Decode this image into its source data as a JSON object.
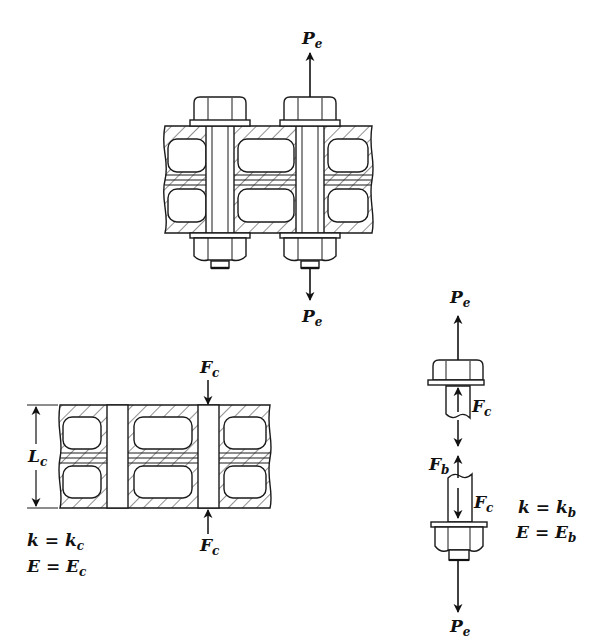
{
  "figure": {
    "assembly": {
      "name": "bolted-assembly",
      "bolt_count": 2,
      "loads": {
        "top": {
          "symbol": "P",
          "subscript": "e"
        },
        "bottom": {
          "symbol": "P",
          "subscript": "e"
        }
      }
    },
    "member_fbd": {
      "name": "member-free-body",
      "dimension": {
        "symbol": "L",
        "subscript": "c"
      },
      "loads": {
        "top": {
          "symbol": "F",
          "subscript": "c"
        },
        "bottom": {
          "symbol": "F",
          "subscript": "c"
        }
      },
      "properties": [
        {
          "lhs": "k",
          "eq": "=",
          "symbol": "k",
          "subscript": "c"
        },
        {
          "lhs": "E",
          "eq": "=",
          "symbol": "E",
          "subscript": "c"
        }
      ]
    },
    "bolt_fbd": {
      "name": "bolt-free-body",
      "loads": {
        "top_external": {
          "symbol": "P",
          "subscript": "e"
        },
        "upper_internal": {
          "symbol": "F",
          "subscript": "c"
        },
        "bolt_force": {
          "symbol": "F",
          "subscript": "b"
        },
        "lower_internal": {
          "symbol": "F",
          "subscript": "c"
        },
        "bottom_external": {
          "symbol": "P",
          "subscript": "e"
        }
      },
      "properties": [
        {
          "lhs": "k",
          "eq": "=",
          "symbol": "k",
          "subscript": "b"
        },
        {
          "lhs": "E",
          "eq": "=",
          "symbol": "E",
          "subscript": "b"
        }
      ]
    }
  }
}
